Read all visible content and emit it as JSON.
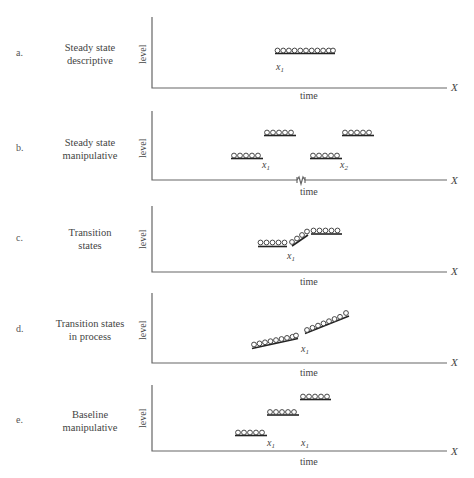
{
  "panels": [
    {
      "letter": "a.",
      "title_line1": "Steady state",
      "title_line2": "descriptive",
      "ylabel": "level",
      "xlabel": "time",
      "axis_end_label": "X",
      "markers": [
        "x1"
      ]
    },
    {
      "letter": "b.",
      "title_line1": "Steady state",
      "title_line2": "manipulative",
      "ylabel": "level",
      "xlabel": "time",
      "axis_end_label": "X",
      "markers": [
        "x1",
        "x2"
      ],
      "axis_break": true
    },
    {
      "letter": "c.",
      "title_line1": "Transition",
      "title_line2": "states",
      "ylabel": "level",
      "xlabel": "time",
      "axis_end_label": "X",
      "markers": [
        "x1"
      ]
    },
    {
      "letter": "d.",
      "title_line1": "Transition states",
      "title_line2": "in process",
      "ylabel": "level",
      "xlabel": "time",
      "axis_end_label": "X",
      "markers": [
        "x1"
      ]
    },
    {
      "letter": "e.",
      "title_line1": "Baseline",
      "title_line2": "manipulative",
      "ylabel": "level",
      "xlabel": "time",
      "axis_end_label": "X",
      "markers": [
        "x1",
        "x1"
      ]
    }
  ],
  "marker_text": {
    "x": "x",
    "sub1": "1",
    "sub2": "2"
  }
}
